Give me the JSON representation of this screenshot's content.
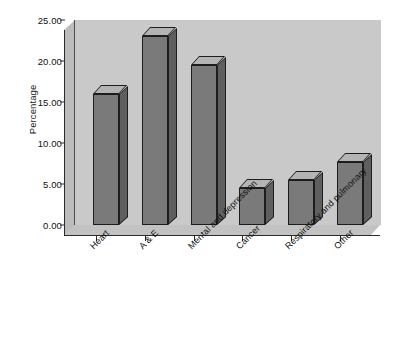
{
  "chart_data": {
    "type": "bar",
    "title": "",
    "subtitle": "",
    "xlabel": "",
    "ylabel": "Percentage",
    "categories": [
      "Heart",
      "A & E",
      "Mental and depression",
      "Cancer",
      "Respiratory and pulmonary",
      "Other"
    ],
    "values": [
      16.0,
      23.0,
      19.5,
      4.5,
      5.5,
      7.7
    ],
    "ylim": [
      0.0,
      25.0
    ],
    "ytick_values": [
      0.0,
      5.0,
      10.0,
      15.0,
      20.0,
      25.0
    ],
    "ytick_labels": [
      "0.00",
      "5.00",
      "10.00",
      "15.00",
      "20.00",
      "25.00"
    ],
    "grid": false,
    "legend": null,
    "legend_position": "none",
    "style": "3d-column",
    "colors": {
      "bar_front": "#7a7a7a",
      "bar_top": "#b4b4b4",
      "bar_side": "#5f5f5f",
      "bar_outline": "#1d1d1d",
      "back_wall": "#c9c9c9",
      "side_wall": "#bcbcbc",
      "floor": "#c2c2c2",
      "axis": "#2a2a2a",
      "text": "#111111",
      "background": "#ffffff"
    }
  }
}
